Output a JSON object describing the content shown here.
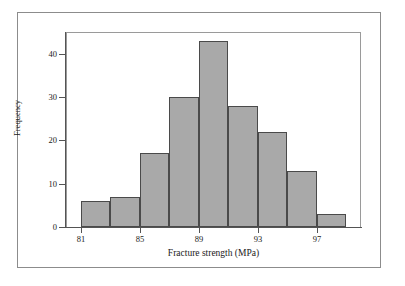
{
  "chart_data": {
    "type": "bar",
    "title": "",
    "subtitle": "",
    "xlabel": "Fracture strength (MPa)",
    "ylabel": "Frequency",
    "categories": [
      "81-83",
      "83-85",
      "85-87",
      "87-89",
      "89-91",
      "91-93",
      "93-95",
      "95-97",
      "97-99"
    ],
    "bin_edges": [
      81,
      83,
      85,
      87,
      89,
      91,
      93,
      95,
      97,
      99
    ],
    "values": [
      6,
      7,
      17,
      30,
      43,
      28,
      22,
      13,
      3
    ],
    "bin_width": 2,
    "xlim": [
      80,
      100
    ],
    "ylim": [
      0,
      45
    ],
    "x_ticks": [
      81,
      85,
      89,
      93,
      97
    ],
    "x_tick_labels": [
      "81",
      "85",
      "89",
      "93",
      "97"
    ],
    "y_ticks": [
      0,
      10,
      20,
      30,
      40
    ],
    "y_tick_labels": [
      "0",
      "10",
      "20",
      "30",
      "40"
    ],
    "grid": false,
    "legend": false,
    "legend_position": "none",
    "bar_fill_color": "#a9a9a9",
    "bar_edge_color": "#4a4a4a",
    "axis_color": "#545454",
    "frame_color": "#8c8c8c",
    "plot_background": "#ffffff",
    "annotations": []
  }
}
